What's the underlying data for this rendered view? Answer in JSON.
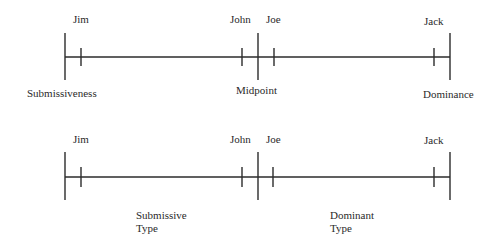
{
  "diagram": {
    "line_color": "#2b2b2b",
    "scales": [
      {
        "id": "continuum",
        "axis_y": 57,
        "left_x": 65,
        "mid_x": 258,
        "right_x": 450,
        "bar_top": 33,
        "bar_bottom": 80,
        "tick_half": 9,
        "people": [
          {
            "name": "Jim",
            "x": 81,
            "label_x": 73,
            "label_y": 13
          },
          {
            "name": "John",
            "x": 242,
            "label_x": 230,
            "label_y": 13
          },
          {
            "name": "Joe",
            "x": 274,
            "label_x": 266,
            "label_y": 13
          },
          {
            "name": "Jack",
            "x": 434,
            "label_x": 424,
            "label_y": 15
          }
        ],
        "bottom_labels": [
          {
            "key": "left",
            "text": "Submissiveness",
            "x": 27,
            "y": 87
          },
          {
            "key": "mid",
            "text": "Midpoint",
            "x": 236,
            "y": 84
          },
          {
            "key": "right",
            "text": "Dominance",
            "x": 423,
            "y": 88
          }
        ]
      },
      {
        "id": "typology",
        "axis_y": 177,
        "left_x": 65,
        "mid_x": 258,
        "right_x": 450,
        "bar_top": 152,
        "bar_bottom": 200,
        "tick_half": 10,
        "people": [
          {
            "name": "Jim",
            "x": 81,
            "label_x": 73,
            "label_y": 133
          },
          {
            "name": "John",
            "x": 242,
            "label_x": 230,
            "label_y": 133
          },
          {
            "name": "Joe",
            "x": 273,
            "label_x": 266,
            "label_y": 133
          },
          {
            "name": "Jack",
            "x": 434,
            "label_x": 424,
            "label_y": 134
          }
        ],
        "bottom_labels": [
          {
            "key": "submissive-type",
            "text": "Submissive\nType",
            "x": 136,
            "y": 209
          },
          {
            "key": "dominant-type",
            "text": "Dominant\nType",
            "x": 330,
            "y": 209
          }
        ]
      }
    ]
  }
}
